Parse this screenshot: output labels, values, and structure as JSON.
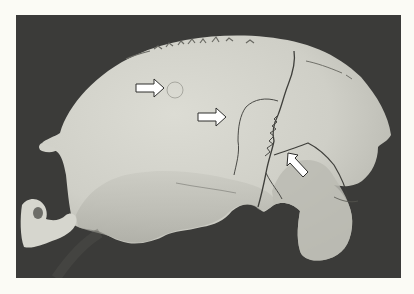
{
  "image": {
    "subject": "lateral view of a partial human cranium (skull fragment) photographed against a dark background",
    "style": "grayscale photograph",
    "colors": {
      "page_background": "#fbfbf5",
      "photo_background": "#3b3b39",
      "bone_light": "#d9d9d1",
      "bone_mid": "#c4c4bb",
      "bone_shadow": "#9e9e96",
      "crack_line": "#4a4a46",
      "arrow_fill": "#ffffff",
      "arrow_outline": "#2e2e2c"
    },
    "annotations": [
      {
        "type": "arrow",
        "direction": "right",
        "position": "upper-left of center, pointing to a small circular depression"
      },
      {
        "type": "arrow",
        "direction": "right",
        "position": "center, pointing to a curved healed fracture margin"
      },
      {
        "type": "arrow",
        "direction": "up-left",
        "position": "right of center, pointing to a fracture line junction"
      }
    ]
  }
}
